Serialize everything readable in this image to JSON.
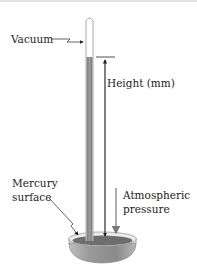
{
  "diagram": {
    "labels": {
      "vacuum": "Vacuum",
      "height": "Height (mm)",
      "mercury_surface_line1": "Mercury",
      "mercury_surface_line2": "surface",
      "atmospheric_line1": "Atmospheric",
      "atmospheric_line2": "pressure"
    },
    "colors": {
      "mercury": "#8a8a8a",
      "mercury_dark": "#6a6a6a",
      "glass": "#bdbdbd",
      "text": "#222222",
      "dish_light": "#d8d8d8"
    }
  }
}
